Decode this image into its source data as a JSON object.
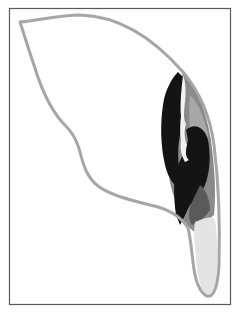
{
  "figure": {
    "frame_color": "#5a5a5a",
    "outline_color": "#a6a6a6",
    "colors": {
      "black_region": "#141414",
      "dark_gray_region": "#4a4a4a",
      "mid_gray_region": "#8a8a8a",
      "light_gray_region": "#b5b5b5",
      "tip_fill": "#e4e4e4",
      "white_streak": "#f2f2f2"
    }
  }
}
